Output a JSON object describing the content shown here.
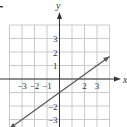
{
  "chart_data": {
    "type": "line",
    "title": "",
    "xlabel": "x",
    "ylabel": "y",
    "xlim": [
      -4,
      4
    ],
    "ylim": [
      -3.5,
      4
    ],
    "grid": true,
    "x_tick_labels": [
      "-3",
      "-2",
      "-1",
      "2",
      "3"
    ],
    "x_ticks": [
      -3,
      -2,
      -1,
      2,
      3
    ],
    "y_tick_labels": [
      "3",
      "2",
      "1",
      "-2",
      "-3"
    ],
    "y_ticks": [
      3,
      2,
      1,
      -2,
      -3
    ],
    "series": [
      {
        "name": "line",
        "equation": "y = (2/3)x - 1",
        "slope": 0.6667,
        "intercept": -1,
        "x": [
          -4,
          4
        ],
        "y": [
          -3.67,
          1.67
        ],
        "arrows": "both",
        "color": "#555555"
      }
    ]
  },
  "labels": {
    "x_axis": "x",
    "y_axis": "y",
    "corner_mark": "."
  },
  "colors": {
    "grid": "#bdbdbd",
    "axis": "#333333",
    "line": "#555555",
    "text": "#333333"
  }
}
